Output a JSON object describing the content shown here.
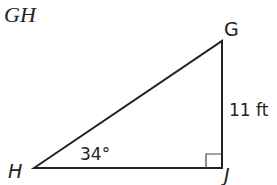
{
  "title": "GH",
  "triangle": {
    "vertices": {
      "G": "G",
      "H": "H",
      "J": "J"
    },
    "side_label": "11 ft",
    "angle_label": "34°",
    "right_angle_at": "J"
  }
}
